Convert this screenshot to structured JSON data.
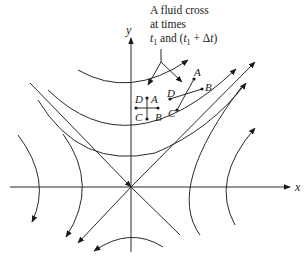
{
  "diagram": {
    "type": "flow-field",
    "caption": {
      "line1": "A fluid cross",
      "line2": "at times",
      "line3_a": "t",
      "line3_sub1": "1",
      "line3_b": " and (",
      "line3_c": "t",
      "line3_sub2": "1",
      "line3_d": " + Δ",
      "line3_e": "t",
      "line3_f": ")"
    },
    "axes": {
      "x_label": "x",
      "y_label": "y"
    },
    "cross_initial": {
      "labels": {
        "A": "A",
        "B": "B",
        "C": "C",
        "D": "D"
      }
    },
    "cross_later": {
      "labels": {
        "A": "A",
        "B": "B",
        "C": "C",
        "D": "D"
      }
    },
    "colors": {
      "line": "#2a2a2a",
      "background": "#ffffff"
    }
  }
}
